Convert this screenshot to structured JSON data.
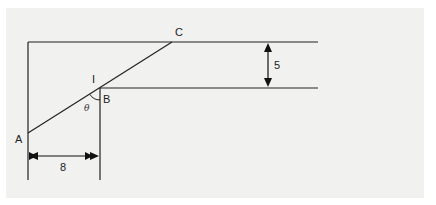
{
  "diagram": {
    "type": "geometry",
    "points": {
      "A": {
        "label": "A"
      },
      "B": {
        "label": "B"
      },
      "C": {
        "label": "C"
      },
      "I": {
        "label": "I"
      }
    },
    "angle_label": "θ",
    "dimensions": {
      "horizontal": {
        "label": "8"
      },
      "vertical": {
        "label": "5"
      }
    },
    "colors": {
      "background": "#f1f1f0",
      "stroke": "#222222"
    }
  }
}
